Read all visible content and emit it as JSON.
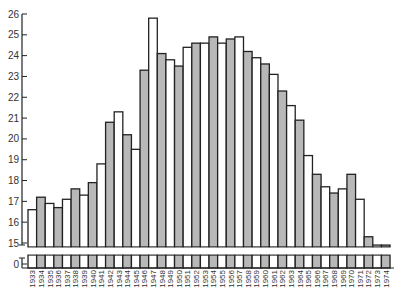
{
  "chart_data": {
    "type": "bar",
    "title": "",
    "xlabel": "",
    "ylabel": "",
    "ylim": [
      15,
      26
    ],
    "axis_break": true,
    "y_ticks": [
      0,
      15,
      16,
      17,
      18,
      19,
      20,
      21,
      22,
      23,
      24,
      25,
      26
    ],
    "grid": false,
    "legend": null,
    "fill_pattern": "alternating white / gray bars",
    "colors": {
      "shaded": "#b8b8b8",
      "white": "#ffffff",
      "stroke": "#222222"
    },
    "categories": [
      "1933",
      "1934",
      "1935",
      "1936",
      "1937",
      "1938",
      "1939",
      "1940",
      "1941",
      "1942",
      "1943",
      "1944",
      "1945",
      "1946",
      "1947",
      "1948",
      "1949",
      "1950",
      "1951",
      "1952",
      "1953",
      "1954",
      "1955",
      "1956",
      "1957",
      "1958",
      "1959",
      "1960",
      "1961",
      "1962",
      "1963",
      "1964",
      "1965",
      "1966",
      "1967",
      "1968",
      "1969",
      "1970",
      "1971",
      "1972",
      "1973",
      "1974"
    ],
    "values": [
      16.6,
      17.2,
      16.9,
      16.7,
      17.1,
      17.6,
      17.3,
      17.9,
      18.8,
      20.8,
      21.3,
      20.2,
      19.5,
      23.3,
      25.8,
      24.1,
      23.8,
      23.5,
      24.4,
      24.6,
      24.6,
      24.9,
      24.6,
      24.8,
      24.9,
      24.2,
      23.9,
      23.6,
      23.1,
      22.3,
      21.6,
      20.9,
      19.2,
      18.3,
      17.7,
      17.4,
      17.6,
      18.3,
      17.1,
      15.3,
      14.9,
      14.9
    ]
  }
}
